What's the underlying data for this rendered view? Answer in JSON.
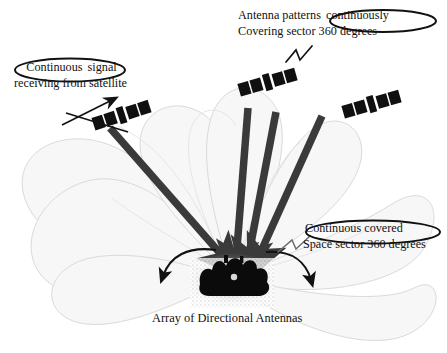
{
  "figure": {
    "background_color": "#ffffff"
  },
  "labels": {
    "antenna_pattern": {
      "line1_prefix": "Antenna patterns ",
      "line1_circled": "continuously",
      "line2": "Covering sector 360 degrees"
    },
    "continuous_signal": {
      "line1_circled": "Continuous",
      "line1_suffix": " signal",
      "line2": "receiving from satellite"
    },
    "continuous_covered": {
      "line1_circled": "Continuous covered",
      "line2": "Space sector 360 degrees"
    },
    "array_caption": "Array of Directional Antennas"
  },
  "colors": {
    "ink": "#111111",
    "beam": "#3a3a3a",
    "lobe_fill": "#f7f7f7",
    "lobe_stroke": "#d8d8d8",
    "satellite_body": "#101010",
    "array_blob": "#0b0b0b",
    "arrow": "#121212"
  },
  "elements": {
    "satellite_count": 3,
    "beam_count": 4,
    "sector_degrees": "360",
    "satellites": [
      {
        "name": "satellite-left",
        "x": 122,
        "y": 115,
        "rotation": -18
      },
      {
        "name": "satellite-center",
        "x": 268,
        "y": 82,
        "rotation": -16
      },
      {
        "name": "satellite-right",
        "x": 372,
        "y": 104,
        "rotation": -16
      }
    ],
    "beams": [
      {
        "name": "beam-left",
        "from_x": 228,
        "from_y": 262,
        "to_x": 110,
        "to_y": 128
      },
      {
        "name": "beam-center-left",
        "from_x": 236,
        "from_y": 263,
        "to_x": 248,
        "to_y": 108
      },
      {
        "name": "beam-center-right",
        "from_x": 244,
        "from_y": 263,
        "to_x": 262,
        "to_y": 106
      },
      {
        "name": "beam-right",
        "from_x": 252,
        "from_y": 262,
        "to_x": 320,
        "to_y": 113
      }
    ],
    "array_center": {
      "x": 232,
      "y": 277
    }
  }
}
